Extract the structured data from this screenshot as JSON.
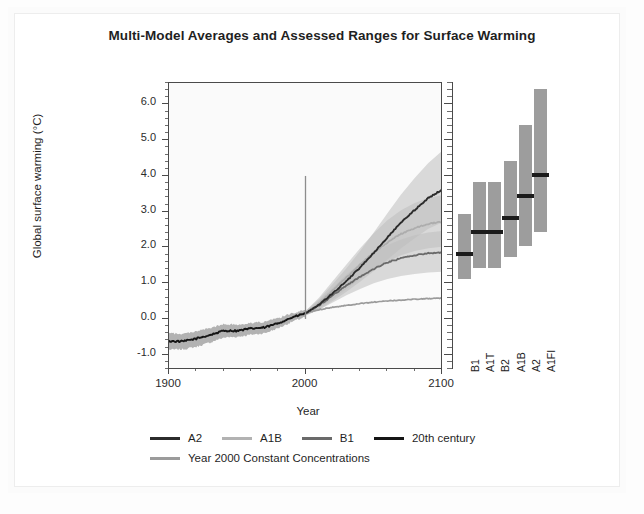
{
  "figure": {
    "title": "Multi-Model Averages and Assessed Ranges for Surface Warming",
    "xlabel": "Year",
    "ylabel": "Global surface warming (°C)"
  },
  "colors": {
    "a2": "#2b2b2b",
    "a1b": "#adadad",
    "b1": "#6a6a6a",
    "twentieth": "#151515",
    "constant": "#9b9b9b",
    "band": "#bdbdbd",
    "band_dark": "#9a9a9a",
    "bar_fill": "#9d9d9d",
    "bar_mark": "#1b1b1b",
    "axis": "#4a4a4a",
    "plot_bg": "#fafafa"
  },
  "legend": {
    "rows": [
      [
        {
          "label": "A2",
          "color": "#2b2b2b"
        },
        {
          "label": "A1B",
          "color": "#b2b2b2"
        },
        {
          "label": "B1",
          "color": "#6a6a6a"
        },
        {
          "label": "20th century",
          "color": "#151515"
        }
      ],
      [
        {
          "label": "Year 2000 Constant Concentrations",
          "color": "#9b9b9b"
        }
      ]
    ]
  },
  "chart_data": {
    "type": "line",
    "title": "Multi-Model Averages and Assessed Ranges for Surface Warming",
    "xlabel": "Year",
    "ylabel": "Global surface warming (°C)",
    "xlim": [
      1900,
      2100
    ],
    "ylim": [
      -1.4,
      6.6
    ],
    "xticks": [
      1900,
      2000,
      2100
    ],
    "xticks_minor": [
      1920,
      1940,
      1960,
      1980,
      2020,
      2040,
      2060,
      2080
    ],
    "yticks": [
      -1.0,
      0.0,
      1.0,
      2.0,
      3.0,
      4.0,
      5.0,
      6.0
    ],
    "ytick_labels": [
      "-1.0",
      "0.0",
      "1.0",
      "2.0",
      "3.0",
      "4.0",
      "5.0",
      "6.0"
    ],
    "grid": false,
    "legend_position": "below",
    "reference_line": {
      "x": 2000,
      "y_from": 0.0,
      "y_to": 4.0
    },
    "x": [
      1900,
      1910,
      1920,
      1930,
      1940,
      1950,
      1960,
      1970,
      1980,
      1990,
      2000,
      2010,
      2020,
      2030,
      2040,
      2050,
      2060,
      2070,
      2080,
      2090,
      2100
    ],
    "series": [
      {
        "name": "20th century",
        "color": "#151515",
        "x": [
          1900,
          1910,
          1920,
          1930,
          1940,
          1950,
          1960,
          1970,
          1980,
          1990,
          2000
        ],
        "values": [
          -0.62,
          -0.63,
          -0.55,
          -0.45,
          -0.33,
          -0.33,
          -0.27,
          -0.24,
          -0.12,
          0.04,
          0.16
        ],
        "band_low": [
          -0.86,
          -0.85,
          -0.78,
          -0.66,
          -0.52,
          -0.5,
          -0.44,
          -0.4,
          -0.26,
          -0.08,
          0.06
        ],
        "band_high": [
          -0.4,
          -0.42,
          -0.34,
          -0.26,
          -0.15,
          -0.16,
          -0.11,
          -0.08,
          0.02,
          0.16,
          0.26
        ]
      },
      {
        "name": "A2",
        "color": "#2b2b2b",
        "x": [
          2000,
          2010,
          2020,
          2030,
          2040,
          2050,
          2060,
          2070,
          2080,
          2090,
          2100
        ],
        "values": [
          0.16,
          0.4,
          0.72,
          1.06,
          1.44,
          1.85,
          2.28,
          2.7,
          3.05,
          3.38,
          3.62
        ],
        "band_low": [
          0.1,
          0.26,
          0.5,
          0.76,
          1.04,
          1.34,
          1.66,
          1.98,
          2.26,
          2.52,
          2.7
        ],
        "band_high": [
          0.22,
          0.56,
          0.98,
          1.42,
          1.9,
          2.42,
          2.96,
          3.48,
          3.94,
          4.36,
          4.7
        ]
      },
      {
        "name": "A1B",
        "color": "#adadad",
        "x": [
          2000,
          2010,
          2020,
          2030,
          2040,
          2050,
          2060,
          2070,
          2080,
          2090,
          2100
        ],
        "values": [
          0.16,
          0.44,
          0.8,
          1.16,
          1.52,
          1.86,
          2.14,
          2.38,
          2.54,
          2.66,
          2.72
        ],
        "band_low": [
          0.1,
          0.3,
          0.56,
          0.84,
          1.12,
          1.38,
          1.6,
          1.78,
          1.9,
          1.98,
          2.02
        ],
        "band_high": [
          0.22,
          0.6,
          1.06,
          1.52,
          1.98,
          2.4,
          2.76,
          3.04,
          3.24,
          3.38,
          3.46
        ]
      },
      {
        "name": "B1",
        "color": "#6a6a6a",
        "x": [
          2000,
          2010,
          2020,
          2030,
          2040,
          2050,
          2060,
          2070,
          2080,
          2090,
          2100
        ],
        "values": [
          0.16,
          0.38,
          0.66,
          0.94,
          1.18,
          1.4,
          1.58,
          1.7,
          1.78,
          1.84,
          1.86
        ],
        "band_low": [
          0.1,
          0.26,
          0.46,
          0.66,
          0.84,
          1.0,
          1.12,
          1.2,
          1.26,
          1.3,
          1.32
        ],
        "band_high": [
          0.22,
          0.52,
          0.88,
          1.24,
          1.56,
          1.84,
          2.06,
          2.22,
          2.34,
          2.42,
          2.46
        ]
      },
      {
        "name": "Year 2000 Constant Concentrations",
        "color": "#9b9b9b",
        "x": [
          2000,
          2010,
          2020,
          2030,
          2040,
          2050,
          2060,
          2070,
          2080,
          2090,
          2100
        ],
        "values": [
          0.16,
          0.26,
          0.33,
          0.38,
          0.43,
          0.47,
          0.5,
          0.53,
          0.55,
          0.57,
          0.58
        ],
        "band_low": [
          0.16,
          0.26,
          0.33,
          0.38,
          0.43,
          0.47,
          0.5,
          0.53,
          0.55,
          0.57,
          0.58
        ],
        "band_high": [
          0.16,
          0.26,
          0.33,
          0.38,
          0.43,
          0.47,
          0.5,
          0.53,
          0.55,
          0.57,
          0.58
        ]
      }
    ],
    "assessed_ranges": {
      "type": "range-bars",
      "ylabel": "Global surface warming (°C)",
      "bars": [
        {
          "label": "B1",
          "low": 1.1,
          "high": 2.9,
          "best": 1.8
        },
        {
          "label": "A1T",
          "low": 1.4,
          "high": 3.8,
          "best": 2.4
        },
        {
          "label": "B2",
          "low": 1.4,
          "high": 3.8,
          "best": 2.4
        },
        {
          "label": "A1B",
          "low": 1.7,
          "high": 4.4,
          "best": 2.8
        },
        {
          "label": "A2",
          "low": 2.0,
          "high": 5.4,
          "best": 3.4
        },
        {
          "label": "A1FI",
          "low": 2.4,
          "high": 6.4,
          "best": 4.0
        }
      ]
    }
  }
}
